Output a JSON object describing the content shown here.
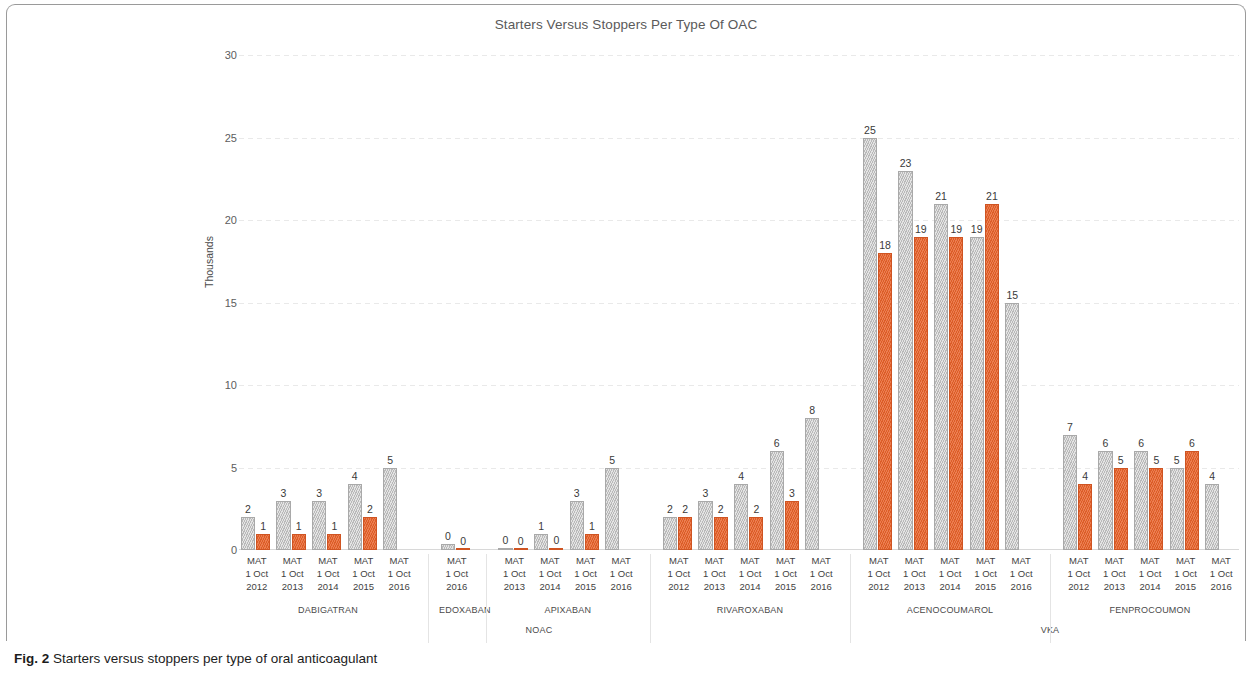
{
  "figure": {
    "caption_prefix": "Fig. 2",
    "caption_text": "Starters versus stoppers per type of oral anticoagulant"
  },
  "chart_data": {
    "type": "bar",
    "title": "Starters Versus Stoppers Per Type Of OAC",
    "xlabel": "",
    "ylabel": "Thousands",
    "ylim": [
      0,
      30
    ],
    "yticks": [
      0,
      5,
      10,
      15,
      20,
      25,
      30
    ],
    "grid": true,
    "legend_position": "none",
    "series": [
      {
        "name": "Starters",
        "color": "#c3c3c3"
      },
      {
        "name": "Stoppers",
        "color": "#e8622a"
      }
    ],
    "class_groups": [
      {
        "label": "NOAC",
        "drugs": [
          "DABIGATRAN",
          "EDOXABAN",
          "APIXABAN",
          "RIVAROXABAN"
        ]
      },
      {
        "label": "VKA",
        "drugs": [
          "ACENOCOUMAROL",
          "FENPROCOUMON"
        ]
      }
    ],
    "groups": [
      {
        "drug": "DABIGATRAN",
        "class": "NOAC",
        "points": [
          {
            "period": [
              "MAT",
              "1 Oct",
              "2012"
            ],
            "starters": 2,
            "stoppers": 1,
            "starters_label": "2",
            "stoppers_label": "1"
          },
          {
            "period": [
              "MAT",
              "1 Oct",
              "2013"
            ],
            "starters": 3,
            "stoppers": 1,
            "starters_label": "3",
            "stoppers_label": "1"
          },
          {
            "period": [
              "MAT",
              "1 Oct",
              "2014"
            ],
            "starters": 3,
            "stoppers": 1,
            "starters_label": "3",
            "stoppers_label": "1"
          },
          {
            "period": [
              "MAT",
              "1 Oct",
              "2015"
            ],
            "starters": 4,
            "stoppers": 2,
            "starters_label": "4",
            "stoppers_label": "2"
          },
          {
            "period": [
              "MAT",
              "1 Oct",
              "2016"
            ],
            "starters": 5,
            "stoppers": null,
            "starters_label": "5",
            "stoppers_label": ""
          }
        ]
      },
      {
        "drug": "EDOXABAN",
        "class": "NOAC",
        "points": [
          {
            "period": [
              "MAT",
              "1 Oct",
              "2016"
            ],
            "starters": 0.35,
            "stoppers": 0.06,
            "starters_label": "0",
            "stoppers_label": "0"
          }
        ]
      },
      {
        "drug": "APIXABAN",
        "class": "NOAC",
        "points": [
          {
            "period": [
              "MAT",
              "1 Oct",
              "2013"
            ],
            "starters": 0.12,
            "stoppers": 0.05,
            "starters_label": "0",
            "stoppers_label": "0"
          },
          {
            "period": [
              "MAT",
              "1 Oct",
              "2014"
            ],
            "starters": 1,
            "stoppers": 0.12,
            "starters_label": "1",
            "stoppers_label": "0"
          },
          {
            "period": [
              "MAT",
              "1 Oct",
              "2015"
            ],
            "starters": 3,
            "stoppers": 1,
            "starters_label": "3",
            "stoppers_label": "1"
          },
          {
            "period": [
              "MAT",
              "1 Oct",
              "2016"
            ],
            "starters": 5,
            "stoppers": null,
            "starters_label": "5",
            "stoppers_label": ""
          }
        ]
      },
      {
        "drug": "RIVAROXABAN",
        "class": "NOAC",
        "points": [
          {
            "period": [
              "MAT",
              "1 Oct",
              "2012"
            ],
            "starters": 2,
            "stoppers": 2,
            "starters_label": "2",
            "stoppers_label": "2"
          },
          {
            "period": [
              "MAT",
              "1 Oct",
              "2013"
            ],
            "starters": 3,
            "stoppers": 2,
            "starters_label": "3",
            "stoppers_label": "2"
          },
          {
            "period": [
              "MAT",
              "1 Oct",
              "2014"
            ],
            "starters": 4,
            "stoppers": 2,
            "starters_label": "4",
            "stoppers_label": "2"
          },
          {
            "period": [
              "MAT",
              "1 Oct",
              "2015"
            ],
            "starters": 6,
            "stoppers": 3,
            "starters_label": "6",
            "stoppers_label": "3"
          },
          {
            "period": [
              "MAT",
              "1 Oct",
              "2016"
            ],
            "starters": 8,
            "stoppers": null,
            "starters_label": "8",
            "stoppers_label": ""
          }
        ]
      },
      {
        "drug": "ACENOCOUMAROL",
        "class": "VKA",
        "points": [
          {
            "period": [
              "MAT",
              "1 Oct",
              "2012"
            ],
            "starters": 25,
            "stoppers": 18,
            "starters_label": "25",
            "stoppers_label": "18"
          },
          {
            "period": [
              "MAT",
              "1 Oct",
              "2013"
            ],
            "starters": 23,
            "stoppers": 19,
            "starters_label": "23",
            "stoppers_label": "19"
          },
          {
            "period": [
              "MAT",
              "1 Oct",
              "2014"
            ],
            "starters": 21,
            "stoppers": 19,
            "starters_label": "21",
            "stoppers_label": "19"
          },
          {
            "period": [
              "MAT",
              "1 Oct",
              "2015"
            ],
            "starters": 19,
            "stoppers": 21,
            "starters_label": "19",
            "stoppers_label": "21"
          },
          {
            "period": [
              "MAT",
              "1 Oct",
              "2016"
            ],
            "starters": 15,
            "stoppers": null,
            "starters_label": "15",
            "stoppers_label": ""
          }
        ]
      },
      {
        "drug": "FENPROCOUMON",
        "class": "VKA",
        "points": [
          {
            "period": [
              "MAT",
              "1 Oct",
              "2012"
            ],
            "starters": 7,
            "stoppers": 4,
            "starters_label": "7",
            "stoppers_label": "4"
          },
          {
            "period": [
              "MAT",
              "1 Oct",
              "2013"
            ],
            "starters": 6,
            "stoppers": 5,
            "starters_label": "6",
            "stoppers_label": "5"
          },
          {
            "period": [
              "MAT",
              "1 Oct",
              "2014"
            ],
            "starters": 6,
            "stoppers": 5,
            "starters_label": "6",
            "stoppers_label": "5"
          },
          {
            "period": [
              "MAT",
              "1 Oct",
              "2015"
            ],
            "starters": 5,
            "stoppers": 6,
            "starters_label": "5",
            "stoppers_label": "6"
          },
          {
            "period": [
              "MAT",
              "1 Oct",
              "2016"
            ],
            "starters": 4,
            "stoppers": null,
            "starters_label": "4",
            "stoppers_label": ""
          }
        ]
      }
    ]
  }
}
